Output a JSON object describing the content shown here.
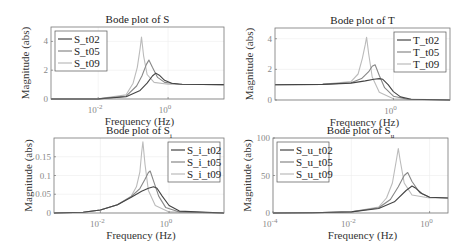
{
  "chart_data": [
    {
      "type": "line",
      "title": "Bode plot of S",
      "xlabel": "Frequency  (Hz)",
      "ylabel": "Magnitude (abs)",
      "xscale": "log",
      "xlim_log10": [
        -3.35,
        1.6
      ],
      "ylim": [
        0,
        5
      ],
      "yticks": [
        0,
        2,
        4
      ],
      "ytick_labels": [
        "0",
        "2",
        "4"
      ],
      "xticks_log10": [
        -2,
        0
      ],
      "xtick_labels": [
        "10-2",
        "100"
      ],
      "grid": true,
      "legend_position": "upper left",
      "box": [
        51,
        27,
        224,
        99
      ],
      "series": [
        {
          "name": "S_t02",
          "color": "#444444",
          "x_log10": [
            -3.35,
            -2,
            -1.2,
            -0.8,
            -0.6,
            -0.45,
            -0.35,
            -0.25,
            -0.1,
            0.1,
            0.4,
            1.6
          ],
          "values": [
            0,
            0.01,
            0.15,
            0.6,
            1.1,
            1.6,
            1.8,
            1.65,
            1.3,
            1.1,
            1.02,
            1.0
          ]
        },
        {
          "name": "S_t05",
          "color": "#888888",
          "x_log10": [
            -3.35,
            -2,
            -1.2,
            -0.9,
            -0.75,
            -0.62,
            -0.55,
            -0.45,
            -0.3,
            -0.1,
            0.3,
            1.6
          ],
          "values": [
            0,
            0.01,
            0.2,
            0.9,
            1.6,
            2.4,
            2.7,
            2.2,
            1.5,
            1.15,
            1.02,
            1.0
          ]
        },
        {
          "name": "S_t09",
          "color": "#bbbbbb",
          "x_log10": [
            -3.35,
            -2,
            -1.2,
            -1.0,
            -0.88,
            -0.8,
            -0.76,
            -0.7,
            -0.6,
            -0.4,
            0.0,
            1.6
          ],
          "values": [
            0,
            0.01,
            0.3,
            1.1,
            2.2,
            3.5,
            4.3,
            3.0,
            1.7,
            1.15,
            1.02,
            1.0
          ]
        }
      ]
    },
    {
      "type": "line",
      "title": "Bode plot of T",
      "xlabel": "Frequency  (Hz)",
      "ylabel": "Magnitude (abs)",
      "xscale": "log",
      "xlim_log10": [
        -3.35,
        1.6
      ],
      "ylim": [
        0,
        4.7
      ],
      "yticks": [
        0,
        2,
        4
      ],
      "ytick_labels": [
        "0",
        "2",
        "4"
      ],
      "xticks_log10": [
        0
      ],
      "xtick_labels": [
        "100"
      ],
      "grid": true,
      "legend_position": "upper right",
      "box": [
        275,
        28,
        450,
        100
      ],
      "series": [
        {
          "name": "T_t02",
          "color": "#444444",
          "x_log10": [
            -3.35,
            -2,
            -1.2,
            -0.8,
            -0.55,
            -0.4,
            -0.3,
            -0.15,
            0.0,
            0.2,
            0.5,
            1.6
          ],
          "values": [
            1.0,
            1.02,
            1.1,
            1.25,
            1.35,
            1.4,
            1.35,
            1.0,
            0.55,
            0.2,
            0.05,
            0.0
          ]
        },
        {
          "name": "T_t05",
          "color": "#888888",
          "x_log10": [
            -3.35,
            -2,
            -1.2,
            -0.9,
            -0.7,
            -0.6,
            -0.52,
            -0.4,
            -0.25,
            0.0,
            0.4,
            1.6
          ],
          "values": [
            1.0,
            1.02,
            1.12,
            1.4,
            1.85,
            2.2,
            2.3,
            1.6,
            0.8,
            0.25,
            0.05,
            0.0
          ]
        },
        {
          "name": "T_t09",
          "color": "#bbbbbb",
          "x_log10": [
            -3.35,
            -2,
            -1.2,
            -1.0,
            -0.88,
            -0.8,
            -0.76,
            -0.7,
            -0.6,
            -0.4,
            0.0,
            1.6
          ],
          "values": [
            1.0,
            1.02,
            1.2,
            1.7,
            2.7,
            3.6,
            4.1,
            3.0,
            1.5,
            0.5,
            0.08,
            0.0
          ]
        }
      ]
    },
    {
      "type": "line",
      "title": "Bode plot of S_i",
      "title_main": "Bode plot of S",
      "title_sub": "i",
      "xlabel": "Frequency  (Hz)",
      "ylabel": "Magnitude (abs)",
      "xscale": "log",
      "xlim_log10": [
        -3.35,
        1.6
      ],
      "ylim": [
        0,
        0.2
      ],
      "yticks": [
        0,
        0.05,
        0.1,
        0.15
      ],
      "ytick_labels": [
        "0",
        "0.05",
        "0.1",
        "0.15"
      ],
      "xticks_log10": [
        -2,
        0
      ],
      "xtick_labels": [
        "10-2",
        "100"
      ],
      "grid": true,
      "legend_position": "upper right",
      "box": [
        54,
        138,
        224,
        213
      ],
      "series": [
        {
          "name": "S_i_t02",
          "color": "#444444",
          "x_log10": [
            -3.35,
            -2.5,
            -2,
            -1.5,
            -1.1,
            -0.8,
            -0.6,
            -0.45,
            -0.35,
            -0.2,
            0.0,
            0.3,
            1.6
          ],
          "values": [
            0,
            0.002,
            0.008,
            0.022,
            0.042,
            0.058,
            0.066,
            0.07,
            0.066,
            0.045,
            0.02,
            0.005,
            0.0
          ]
        },
        {
          "name": "S_i_t05",
          "color": "#888888",
          "x_log10": [
            -3.35,
            -2.5,
            -2,
            -1.5,
            -1.1,
            -0.85,
            -0.7,
            -0.6,
            -0.55,
            -0.45,
            -0.3,
            -0.1,
            0.3,
            1.6
          ],
          "values": [
            0,
            0.002,
            0.008,
            0.022,
            0.044,
            0.065,
            0.09,
            0.108,
            0.112,
            0.085,
            0.045,
            0.015,
            0.003,
            0.0
          ]
        },
        {
          "name": "S_i_t09",
          "color": "#bbbbbb",
          "x_log10": [
            -3.35,
            -2.5,
            -2,
            -1.5,
            -1.1,
            -0.95,
            -0.85,
            -0.8,
            -0.76,
            -0.7,
            -0.6,
            -0.4,
            0.0,
            1.6
          ],
          "values": [
            0,
            0.002,
            0.008,
            0.022,
            0.045,
            0.07,
            0.11,
            0.16,
            0.19,
            0.13,
            0.06,
            0.02,
            0.003,
            0.0
          ]
        }
      ]
    },
    {
      "type": "line",
      "title": "Bode plot of S_u",
      "title_main": "Bode plot of S",
      "title_sub": "u",
      "xlabel": "Frequency  (Hz)",
      "ylabel": "Magnitude (abs)",
      "xscale": "log",
      "xlim_log10": [
        -4,
        0.47
      ],
      "ylim": [
        0,
        100
      ],
      "yticks": [
        0,
        50,
        100
      ],
      "ytick_labels": [
        "0",
        "50",
        "100"
      ],
      "xticks_log10": [
        -4,
        -2,
        0
      ],
      "xtick_labels": [
        "10-4",
        "10-2",
        "100"
      ],
      "grid": true,
      "legend_position": "upper left",
      "box": [
        273,
        138,
        448,
        213
      ],
      "series": [
        {
          "name": "S_u_t02",
          "color": "#444444",
          "x_log10": [
            -4,
            -3,
            -2,
            -1.3,
            -0.9,
            -0.6,
            -0.45,
            -0.35,
            -0.2,
            0.0,
            0.47
          ],
          "values": [
            0,
            0.2,
            1.5,
            6,
            15,
            30,
            36,
            33,
            26,
            21,
            20
          ]
        },
        {
          "name": "S_u_t05",
          "color": "#888888",
          "x_log10": [
            -4,
            -3,
            -2,
            -1.3,
            -1.0,
            -0.8,
            -0.65,
            -0.56,
            -0.45,
            -0.25,
            0.0,
            0.47
          ],
          "values": [
            0,
            0.2,
            1.5,
            7,
            18,
            35,
            50,
            54,
            42,
            27,
            21,
            20
          ]
        },
        {
          "name": "S_u_t09",
          "color": "#bbbbbb",
          "x_log10": [
            -4,
            -3,
            -2,
            -1.3,
            -1.1,
            -0.95,
            -0.85,
            -0.8,
            -0.75,
            -0.65,
            -0.45,
            0.0,
            0.47
          ],
          "values": [
            0,
            0.2,
            1.5,
            8,
            20,
            40,
            70,
            86,
            70,
            40,
            24,
            20,
            20
          ]
        }
      ]
    }
  ],
  "exponent_labels": {
    "m4": "-4",
    "m2": "-2",
    "zero": "0",
    "base": "10"
  }
}
